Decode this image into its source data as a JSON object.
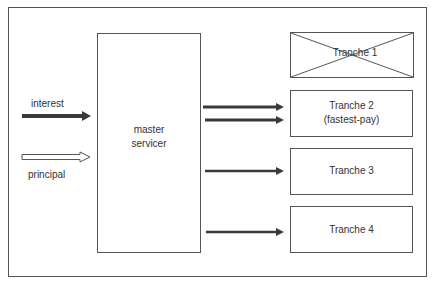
{
  "diagram": {
    "inputs": [
      {
        "id": "interest",
        "label": "interest",
        "arrow_style": "solid"
      },
      {
        "id": "principal",
        "label": "principal",
        "arrow_style": "hollow"
      }
    ],
    "master": {
      "line1": "master",
      "line2": "servicer"
    },
    "tranches": [
      {
        "id": "tranche-1",
        "label": "Tranche 1",
        "sublabel": "",
        "crossed_out": true,
        "incoming_arrows": 0
      },
      {
        "id": "tranche-2",
        "label": "Tranche 2",
        "sublabel": "(fastest-pay)",
        "crossed_out": false,
        "incoming_arrows": 2
      },
      {
        "id": "tranche-3",
        "label": "Tranche 3",
        "sublabel": "",
        "crossed_out": false,
        "incoming_arrows": 1
      },
      {
        "id": "tranche-4",
        "label": "Tranche 4",
        "sublabel": "",
        "crossed_out": false,
        "incoming_arrows": 1
      }
    ],
    "colors": {
      "line": "#555555",
      "arrow": "#3a3a3a",
      "background": "#ffffff"
    }
  }
}
